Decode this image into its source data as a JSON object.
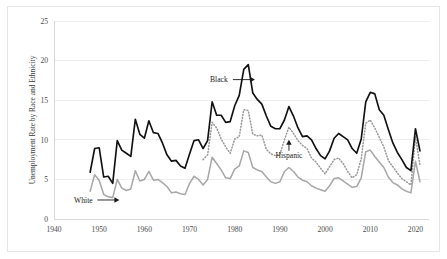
{
  "chart_data": {
    "type": "line",
    "title": "",
    "subtitle": "",
    "xlabel": "",
    "ylabel": "Unemployment Rate by Race and Ethnicity",
    "xlim": [
      1940,
      2023
    ],
    "ylim": [
      0,
      25
    ],
    "grid": true,
    "legend_position": "none-inline-annotations",
    "x_ticks": [
      1940,
      1950,
      1960,
      1970,
      1980,
      1990,
      2000,
      2010,
      2020
    ],
    "x_tick_labels": [
      "1940",
      "1950",
      "1960",
      "1970",
      "1980",
      "1990",
      "2000",
      "2010",
      "2020"
    ],
    "y_ticks": [
      0,
      5,
      10,
      15,
      20,
      25
    ],
    "y_tick_labels": [
      "0",
      "5",
      "10",
      "15",
      "20",
      "25"
    ],
    "annotations": [
      {
        "name": "black-annotation",
        "label": "Black",
        "arrow": "right",
        "x": 1976.5,
        "y": 17.6
      },
      {
        "name": "hispanic-annotation",
        "label": "Hispanic",
        "arrow": "up",
        "x": 1992.0,
        "y": 8.1
      },
      {
        "name": "white-annotation",
        "label": "White",
        "arrow": "right",
        "x": 1946.5,
        "y": 2.4
      }
    ],
    "series": [
      {
        "name": "Black",
        "color": "#111111",
        "style": "solid",
        "x": [
          1948,
          1949,
          1950,
          1951,
          1952,
          1953,
          1954,
          1955,
          1956,
          1957,
          1958,
          1959,
          1960,
          1961,
          1962,
          1963,
          1964,
          1965,
          1966,
          1967,
          1968,
          1969,
          1970,
          1971,
          1972,
          1973,
          1974,
          1975,
          1976,
          1977,
          1978,
          1979,
          1980,
          1981,
          1982,
          1983,
          1984,
          1985,
          1986,
          1987,
          1988,
          1989,
          1990,
          1991,
          1992,
          1993,
          1994,
          1995,
          1996,
          1997,
          1998,
          1999,
          2000,
          2001,
          2002,
          2003,
          2004,
          2005,
          2006,
          2007,
          2008,
          2009,
          2010,
          2011,
          2012,
          2013,
          2014,
          2015,
          2016,
          2017,
          2018,
          2019,
          2020,
          2021
        ],
        "values": [
          5.9,
          8.9,
          9.0,
          5.3,
          5.4,
          4.5,
          9.9,
          8.7,
          8.3,
          7.9,
          12.6,
          10.7,
          10.2,
          12.4,
          10.9,
          10.8,
          9.6,
          8.1,
          7.3,
          7.4,
          6.7,
          6.4,
          8.2,
          9.9,
          10.0,
          8.9,
          9.9,
          14.8,
          13.1,
          13.1,
          12.2,
          12.3,
          14.3,
          15.6,
          18.9,
          19.5,
          15.9,
          15.1,
          14.5,
          13.0,
          11.7,
          11.4,
          11.4,
          12.5,
          14.2,
          13.0,
          11.5,
          10.4,
          10.5,
          10.0,
          8.9,
          8.0,
          7.6,
          8.6,
          10.2,
          10.8,
          10.4,
          10.0,
          8.9,
          8.3,
          10.1,
          14.8,
          16.0,
          15.8,
          13.8,
          13.1,
          11.3,
          9.6,
          8.4,
          7.5,
          6.5,
          6.1,
          11.4,
          8.6
        ]
      },
      {
        "name": "Hispanic",
        "color": "#9a9a9a",
        "style": "dotted",
        "x": [
          1973,
          1974,
          1975,
          1976,
          1977,
          1978,
          1979,
          1980,
          1981,
          1982,
          1983,
          1984,
          1985,
          1986,
          1987,
          1988,
          1989,
          1990,
          1991,
          1992,
          1993,
          1994,
          1995,
          1996,
          1997,
          1998,
          1999,
          2000,
          2001,
          2002,
          2003,
          2004,
          2005,
          2006,
          2007,
          2008,
          2009,
          2010,
          2011,
          2012,
          2013,
          2014,
          2015,
          2016,
          2017,
          2018,
          2019,
          2020,
          2021
        ],
        "values": [
          7.5,
          8.1,
          12.2,
          11.5,
          10.1,
          9.1,
          8.3,
          10.1,
          10.4,
          13.8,
          13.7,
          10.7,
          10.5,
          10.6,
          8.8,
          8.2,
          8.0,
          8.2,
          10.0,
          11.6,
          10.8,
          9.9,
          9.3,
          8.9,
          7.7,
          7.2,
          6.4,
          5.7,
          6.6,
          7.5,
          7.7,
          7.0,
          6.0,
          5.2,
          5.6,
          7.6,
          12.1,
          12.5,
          11.5,
          10.3,
          9.1,
          7.4,
          6.6,
          5.8,
          5.1,
          4.7,
          4.3,
          10.4,
          6.8
        ]
      },
      {
        "name": "White",
        "color": "#a8a8a8",
        "style": "solid",
        "x": [
          1948,
          1949,
          1950,
          1951,
          1952,
          1953,
          1954,
          1955,
          1956,
          1957,
          1958,
          1959,
          1960,
          1961,
          1962,
          1963,
          1964,
          1965,
          1966,
          1967,
          1968,
          1969,
          1970,
          1971,
          1972,
          1973,
          1974,
          1975,
          1976,
          1977,
          1978,
          1979,
          1980,
          1981,
          1982,
          1983,
          1984,
          1985,
          1986,
          1987,
          1988,
          1989,
          1990,
          1991,
          1992,
          1993,
          1994,
          1995,
          1996,
          1997,
          1998,
          1999,
          2000,
          2001,
          2002,
          2003,
          2004,
          2005,
          2006,
          2007,
          2008,
          2009,
          2010,
          2011,
          2012,
          2013,
          2014,
          2015,
          2016,
          2017,
          2018,
          2019,
          2020,
          2021
        ],
        "values": [
          3.5,
          5.6,
          4.9,
          3.1,
          2.8,
          2.7,
          5.0,
          3.9,
          3.6,
          3.8,
          6.1,
          4.8,
          5.0,
          6.0,
          4.9,
          5.0,
          4.6,
          4.1,
          3.3,
          3.4,
          3.2,
          3.1,
          4.5,
          5.4,
          5.0,
          4.3,
          5.0,
          7.8,
          7.0,
          6.2,
          5.2,
          5.1,
          6.3,
          6.7,
          8.6,
          8.4,
          6.5,
          6.2,
          6.0,
          5.3,
          4.7,
          4.5,
          4.7,
          6.0,
          6.5,
          6.0,
          5.3,
          4.9,
          4.7,
          4.2,
          3.9,
          3.7,
          3.5,
          4.2,
          5.1,
          5.2,
          4.8,
          4.4,
          4.0,
          4.1,
          5.2,
          8.5,
          8.7,
          7.9,
          7.2,
          6.5,
          5.3,
          4.6,
          4.3,
          3.8,
          3.5,
          3.3,
          7.3,
          4.7
        ]
      }
    ]
  },
  "figure": {
    "background_color": "#ffffff",
    "border_color": "#e6e6e6",
    "gridline_color": "#ededed"
  }
}
